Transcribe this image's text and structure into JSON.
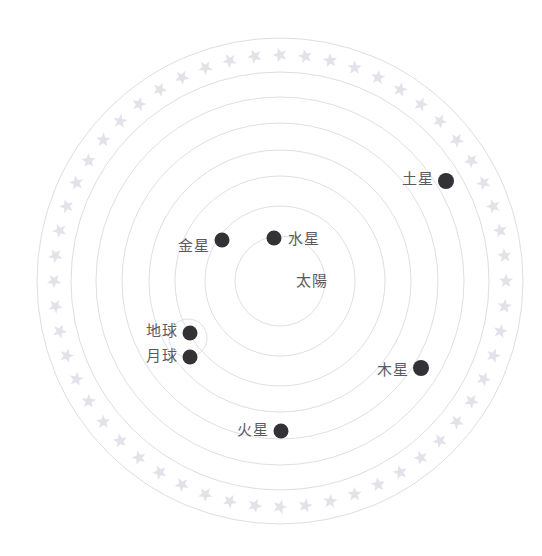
{
  "scene": {
    "kind": "heliocentric-solar-system-diagram",
    "background": "#ffffff",
    "orbit_color": "#d9d9de",
    "star_color": "#e2e2e8",
    "body_color": "#333337",
    "text_color": "#5b5b5f",
    "center": {
      "x": 280,
      "y": 281
    },
    "star_ring": {
      "count": 56,
      "radius": 226,
      "star_size": 15
    },
    "rings": [
      {
        "name": "outer-boundary-outer",
        "radius": 243
      },
      {
        "name": "outer-boundary-inner",
        "radius": 209
      },
      {
        "name": "orbit-saturn",
        "radius": 184
      },
      {
        "name": "orbit-jupiter",
        "radius": 158
      },
      {
        "name": "orbit-mars",
        "radius": 131
      },
      {
        "name": "orbit-earth",
        "radius": 105
      },
      {
        "name": "orbit-venus",
        "radius": 75
      },
      {
        "name": "orbit-mercury",
        "radius": 45
      }
    ],
    "moon_orbit": {
      "cx": 188,
      "cy": 338,
      "radius": 19
    }
  },
  "bodies": [
    {
      "id": "sun",
      "label": "太陽",
      "x": 280,
      "y": 281,
      "dot": 0,
      "label_x": 312,
      "label_y": 281,
      "label_align": "c",
      "has_dot": false
    },
    {
      "id": "mercury",
      "label": "水星",
      "x": 274,
      "y": 238,
      "dot": 7.5,
      "label_x": 288,
      "label_y": 239,
      "label_align": "l",
      "has_dot": true
    },
    {
      "id": "venus",
      "label": "金星",
      "x": 222,
      "y": 240,
      "dot": 7.5,
      "label_x": 210,
      "label_y": 246,
      "label_align": "r",
      "has_dot": true
    },
    {
      "id": "earth",
      "label": "地球",
      "x": 190,
      "y": 333,
      "dot": 7.5,
      "label_x": 178,
      "label_y": 331,
      "label_align": "r",
      "has_dot": true
    },
    {
      "id": "moon",
      "label": "月球",
      "x": 190,
      "y": 357,
      "dot": 7.5,
      "label_x": 178,
      "label_y": 356,
      "label_align": "r",
      "has_dot": true
    },
    {
      "id": "mars",
      "label": "火星",
      "x": 281,
      "y": 431,
      "dot": 7.5,
      "label_x": 269,
      "label_y": 430,
      "label_align": "r",
      "has_dot": true
    },
    {
      "id": "jupiter",
      "label": "木星",
      "x": 421,
      "y": 368,
      "dot": 8,
      "label_x": 409,
      "label_y": 370,
      "label_align": "r",
      "has_dot": true
    },
    {
      "id": "saturn",
      "label": "土星",
      "x": 446,
      "y": 181,
      "dot": 8,
      "label_x": 434,
      "label_y": 179,
      "label_align": "r",
      "has_dot": true
    }
  ]
}
